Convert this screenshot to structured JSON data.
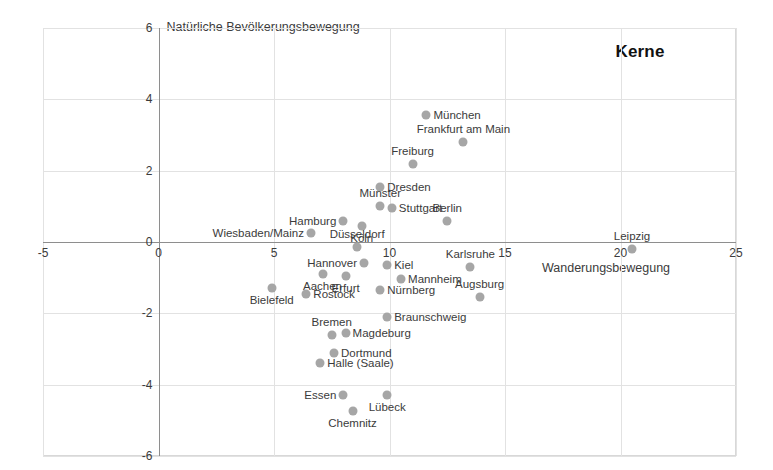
{
  "chart_data": {
    "type": "scatter",
    "title": "Kerne",
    "xlabel": "Wanderungsbewegung",
    "ylabel": "Natürliche Bevölkerungsbewegung",
    "xlim": [
      -5,
      25
    ],
    "ylim": [
      -6,
      6
    ],
    "xticks": [
      -5,
      0,
      5,
      10,
      15,
      20,
      25
    ],
    "yticks": [
      -6,
      -4,
      -2,
      0,
      2,
      4,
      6
    ],
    "grid": true,
    "legend": "none",
    "point_color": "#a6a6a6",
    "points": [
      {
        "label": "München",
        "x": 11.6,
        "y": 3.55,
        "label_pos": "right"
      },
      {
        "label": "Frankfurt am Main",
        "x": 13.2,
        "y": 2.8,
        "label_pos": "above"
      },
      {
        "label": "Freiburg",
        "x": 11.0,
        "y": 2.2,
        "label_pos": "above"
      },
      {
        "label": "Dresden",
        "x": 9.6,
        "y": 1.55,
        "label_pos": "right"
      },
      {
        "label": "Münster",
        "x": 9.6,
        "y": 1.0,
        "label_pos": "above"
      },
      {
        "label": "Stuttgart",
        "x": 10.1,
        "y": 0.95,
        "label_pos": "right"
      },
      {
        "label": "Berlin",
        "x": 12.5,
        "y": 0.6,
        "label_pos": "above"
      },
      {
        "label": "Hamburg",
        "x": 8.0,
        "y": 0.6,
        "label_pos": "left"
      },
      {
        "label": "Köln",
        "x": 8.8,
        "y": 0.45,
        "label_pos": "below"
      },
      {
        "label": "Wiesbaden/Mainz",
        "x": 6.6,
        "y": 0.25,
        "label_pos": "left"
      },
      {
        "label": "Düsseldorf",
        "x": 8.6,
        "y": -0.15,
        "label_pos": "above"
      },
      {
        "label": "Leipzig",
        "x": 20.5,
        "y": -0.2,
        "label_pos": "above"
      },
      {
        "label": "Hannover",
        "x": 8.9,
        "y": -0.6,
        "label_pos": "left"
      },
      {
        "label": "Kiel",
        "x": 9.9,
        "y": -0.65,
        "label_pos": "right"
      },
      {
        "label": "Karlsruhe",
        "x": 13.5,
        "y": -0.7,
        "label_pos": "above"
      },
      {
        "label": "Erfurt",
        "x": 8.1,
        "y": -0.95,
        "label_pos": "below"
      },
      {
        "label": "Aachen",
        "x": 7.1,
        "y": -0.9,
        "label_pos": "below"
      },
      {
        "label": "Mannheim",
        "x": 10.5,
        "y": -1.05,
        "label_pos": "right"
      },
      {
        "label": "Nürnberg",
        "x": 9.6,
        "y": -1.35,
        "label_pos": "right"
      },
      {
        "label": "Rostock",
        "x": 6.4,
        "y": -1.45,
        "label_pos": "right"
      },
      {
        "label": "Bielefeld",
        "x": 4.9,
        "y": -1.3,
        "label_pos": "below"
      },
      {
        "label": "Augsburg",
        "x": 13.9,
        "y": -1.55,
        "label_pos": "above"
      },
      {
        "label": "Braunschweig",
        "x": 9.9,
        "y": -2.1,
        "label_pos": "right"
      },
      {
        "label": "Magdeburg",
        "x": 8.1,
        "y": -2.55,
        "label_pos": "right"
      },
      {
        "label": "Bremen",
        "x": 7.5,
        "y": -2.6,
        "label_pos": "above"
      },
      {
        "label": "Dortmund",
        "x": 7.6,
        "y": -3.1,
        "label_pos": "right"
      },
      {
        "label": "Halle (Saale)",
        "x": 7.0,
        "y": -3.4,
        "label_pos": "right"
      },
      {
        "label": "Essen",
        "x": 8.0,
        "y": -4.3,
        "label_pos": "left"
      },
      {
        "label": "Lübeck",
        "x": 9.9,
        "y": -4.3,
        "label_pos": "below"
      },
      {
        "label": "Chemnitz",
        "x": 8.4,
        "y": -4.75,
        "label_pos": "below"
      }
    ]
  }
}
